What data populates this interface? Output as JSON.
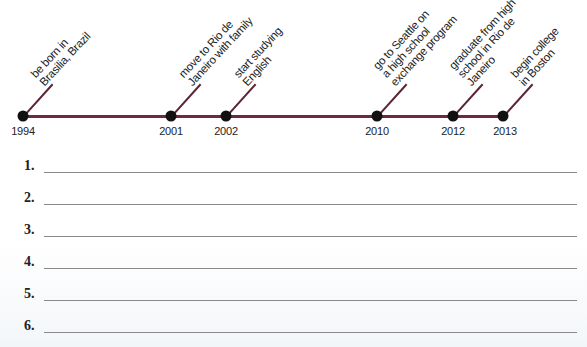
{
  "timeline": {
    "line_color": "#6e2b40",
    "events": [
      {
        "year": "1994",
        "x": 23,
        "lines": [
          "be born in",
          "Brasilia, Brazil"
        ]
      },
      {
        "year": "2001",
        "x": 171,
        "lines": [
          "move to Rio de",
          "Janeiro with family"
        ]
      },
      {
        "year": "2002",
        "x": 226,
        "lines": [
          "start studying",
          "English"
        ]
      },
      {
        "year": "2010",
        "x": 377,
        "lines": [
          "go to Seattle on",
          "a high school",
          "exchange program"
        ]
      },
      {
        "year": "2012",
        "x": 453,
        "lines": [
          "graduate from high",
          "school in Rio de",
          "Janeiro"
        ]
      },
      {
        "year": "2013",
        "x": 503,
        "lines": [
          "begin college",
          "in Boston"
        ]
      }
    ]
  },
  "answers": {
    "items": [
      {
        "number": "1.",
        "value": ""
      },
      {
        "number": "2.",
        "value": ""
      },
      {
        "number": "3.",
        "value": ""
      },
      {
        "number": "4.",
        "value": ""
      },
      {
        "number": "5.",
        "value": ""
      },
      {
        "number": "6.",
        "value": ""
      }
    ]
  }
}
